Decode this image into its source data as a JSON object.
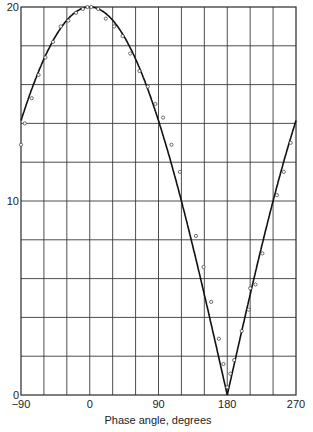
{
  "chart_data": {
    "type": "scatter",
    "title": "",
    "xlabel": "Phase angle, degrees",
    "ylabel": "",
    "xlim": [
      -90,
      270
    ],
    "ylim": [
      0,
      20
    ],
    "grid": true,
    "x_gridlines_every": 30,
    "y_gridlines_every": 2,
    "x_tick_labels": [
      "−90",
      "0",
      "90",
      "180",
      "270"
    ],
    "x_ticks": [
      -90,
      0,
      90,
      180,
      270
    ],
    "y_tick_labels": [
      "0",
      "10",
      "20"
    ],
    "y_ticks": [
      0,
      10,
      20
    ],
    "legend": null,
    "series": [
      {
        "name": "measured points",
        "style": "open-circles",
        "x": [
          -90,
          -85,
          -76,
          -67,
          -58,
          -48,
          -38,
          -28,
          -18,
          -9,
          -3,
          2,
          11,
          21,
          32,
          43,
          53,
          65,
          76,
          86,
          96,
          107,
          118,
          139,
          149,
          159,
          169,
          175,
          180,
          184,
          189,
          199,
          208,
          210,
          217,
          226,
          245,
          254,
          263
        ],
        "y": [
          12.9,
          14.0,
          15.3,
          16.5,
          17.4,
          18.2,
          19.0,
          19.3,
          19.7,
          19.9,
          20.0,
          20.0,
          19.9,
          19.4,
          19.0,
          18.5,
          17.6,
          16.7,
          15.9,
          15.0,
          14.3,
          12.9,
          11.5,
          8.2,
          6.6,
          4.8,
          2.9,
          1.6,
          0.4,
          1.1,
          1.8,
          3.3,
          4.4,
          5.5,
          5.7,
          7.3,
          10.3,
          11.5,
          13.0
        ]
      },
      {
        "name": "fitted curve",
        "style": "solid-line",
        "formula": "20*|cos(theta/2)|",
        "x": [
          -90,
          -75,
          -60,
          -45,
          -30,
          -15,
          0,
          15,
          30,
          45,
          60,
          75,
          90,
          105,
          120,
          135,
          150,
          165,
          180,
          195,
          210,
          225,
          240,
          255,
          270
        ],
        "y": [
          13.2,
          15.0,
          16.5,
          17.8,
          18.9,
          19.7,
          20.0,
          19.8,
          19.2,
          18.3,
          17.1,
          15.6,
          14.0,
          12.2,
          10.2,
          7.9,
          5.4,
          2.7,
          0.0,
          2.6,
          5.2,
          7.7,
          10.0,
          12.1,
          13.2
        ]
      }
    ]
  }
}
